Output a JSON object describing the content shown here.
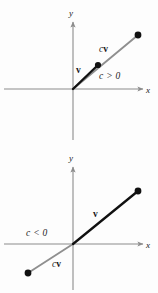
{
  "figure": {
    "colors": {
      "axis": "#8c8c8c",
      "vector_v": "#111111",
      "vector_cv": "#8f8f8f",
      "point": "#111111",
      "label": "#1a1a1a",
      "background": "#fdfdfd"
    },
    "panels": [
      {
        "id": "panel-positive-scalar",
        "condition_label": "c > 0",
        "axes": {
          "x_label": "x",
          "y_label": "y",
          "origin": [
            73,
            89
          ],
          "x_axis_from": [
            4,
            89
          ],
          "x_axis_to": [
            145,
            89
          ],
          "y_axis_from": [
            73,
            140
          ],
          "y_axis_to": [
            73,
            20
          ]
        },
        "vectors": [
          {
            "name": "v",
            "label": "v",
            "label_pos": [
              75,
              72
            ],
            "from": [
              73,
              89
            ],
            "to": [
              98,
              65
            ],
            "color": "#111111",
            "width": 2.2,
            "endpoint_dot": true
          },
          {
            "name": "cv",
            "label_c": "c",
            "label_v": "v",
            "label_pos": [
              98,
              52
            ],
            "from": [
              98,
              65
            ],
            "to": [
              138,
              35
            ],
            "color": "#8f8f8f",
            "width": 1.8,
            "endpoint_dot": true
          }
        ],
        "condition_pos": [
          99,
          79
        ]
      },
      {
        "id": "panel-negative-scalar",
        "condition_label": "c < 0",
        "axes": {
          "x_label": "x",
          "y_label": "y",
          "origin": [
            73,
            97
          ],
          "x_axis_from": [
            4,
            97
          ],
          "x_axis_to": [
            145,
            97
          ],
          "y_axis_from": [
            73,
            143
          ],
          "y_axis_to": [
            73,
            18
          ]
        },
        "vectors": [
          {
            "name": "v",
            "label": "v",
            "label_pos": [
              93,
              69
            ],
            "from": [
              73,
              97
            ],
            "to": [
              138,
              44
            ],
            "color": "#111111",
            "width": 2.2,
            "endpoint_dot": true
          },
          {
            "name": "cv",
            "label_c": "c",
            "label_v": "v",
            "label_pos": [
              52,
              119
            ],
            "from": [
              73,
              97
            ],
            "to": [
              28,
              126
            ],
            "color": "#8f8f8f",
            "width": 1.8,
            "endpoint_dot": true
          }
        ],
        "condition_pos": [
          26,
          88
        ]
      }
    ]
  }
}
